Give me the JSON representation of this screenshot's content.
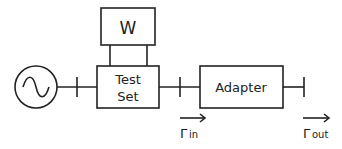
{
  "diagram": {
    "title": "",
    "source": {
      "symbol": "ac-source",
      "glyph": "~"
    },
    "meter": {
      "label": "W"
    },
    "test_set": {
      "line1": "Test",
      "line2": "Set"
    },
    "adapter": {
      "label": "Adapter"
    },
    "reflection_in": {
      "symbol": "Γ",
      "subscript": "in"
    },
    "reflection_out": {
      "symbol": "Γ",
      "subscript": "out"
    },
    "colors": {
      "stroke": "#222222",
      "background": "#ffffff"
    }
  }
}
